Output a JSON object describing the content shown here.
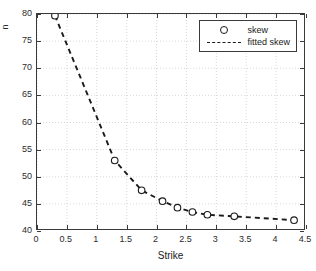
{
  "chart_data": {
    "type": "scatter",
    "title": "",
    "xlabel": "Strike",
    "ylabel": "",
    "xlim": [
      0,
      4.5
    ],
    "ylim": [
      40,
      80
    ],
    "grid": true,
    "legend_position": "top-right",
    "xticks": [
      "0",
      "0.5",
      "1",
      "1.5",
      "2",
      "2.5",
      "3",
      "3.5",
      "4",
      "4.5"
    ],
    "xtick_values": [
      0,
      0.5,
      1,
      1.5,
      2,
      2.5,
      3,
      3.5,
      4,
      4.5
    ],
    "yticks": [
      "40",
      "45",
      "50",
      "55",
      "60",
      "65",
      "70",
      "75",
      "80"
    ],
    "ytick_values": [
      40,
      45,
      50,
      55,
      60,
      65,
      70,
      75,
      80
    ],
    "series": [
      {
        "name": "skew",
        "style": "markers",
        "marker": "circle-open",
        "color": "#1a1a1a",
        "x": [
          0.3,
          1.3,
          1.75,
          2.1,
          2.35,
          2.6,
          2.85,
          3.3,
          4.3
        ],
        "y": [
          79.7,
          53.0,
          47.5,
          45.5,
          44.3,
          43.5,
          43.0,
          42.7,
          42.0
        ]
      },
      {
        "name": "fitted skew",
        "style": "dashed-line",
        "color": "#1a1a1a",
        "x": [
          0.3,
          1.3,
          1.75,
          2.1,
          2.35,
          2.6,
          2.85,
          3.3,
          4.3
        ],
        "y": [
          79.7,
          53.0,
          47.5,
          45.5,
          44.3,
          43.5,
          43.0,
          42.7,
          42.0
        ]
      }
    ]
  },
  "legend": {
    "items": [
      {
        "label": "skew"
      },
      {
        "label": "fitted skew"
      }
    ]
  },
  "axis": {
    "xlabel": "Strike",
    "ylabel_fragment": "n"
  }
}
